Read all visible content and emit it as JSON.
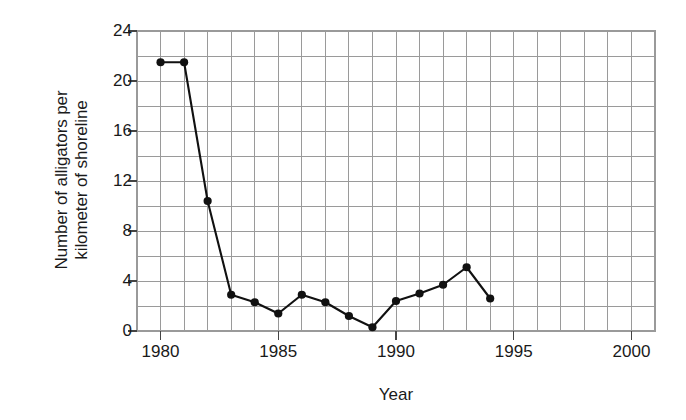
{
  "chart_data": {
    "type": "line",
    "title": "",
    "xlabel": "Year",
    "ylabel": "Number of alligators per kilometer of shoreline",
    "ylabel_lines": [
      "Number of alligators per",
      "kilometer of shoreline"
    ],
    "xlim": [
      1979,
      2001
    ],
    "ylim": [
      0,
      24
    ],
    "x_major_ticks": [
      1980,
      1985,
      1990,
      1995,
      2000
    ],
    "x_major_tick_labels": [
      "1980",
      "1985",
      "1990",
      "1995",
      "2000"
    ],
    "x_gridline_step": 1,
    "y_major_ticks": [
      0,
      4,
      8,
      12,
      16,
      20,
      24
    ],
    "y_major_tick_labels": [
      "0",
      "4",
      "8",
      "12",
      "16",
      "20",
      "24"
    ],
    "y_gridline_step": 2,
    "grid": true,
    "grid_color": "#9a9a9a",
    "legend": "none",
    "line_color": "#111111",
    "marker_color": "#111111",
    "marker_style": "filled-circle",
    "x": [
      1980,
      1981,
      1982,
      1983,
      1984,
      1985,
      1986,
      1987,
      1988,
      1989,
      1990,
      1991,
      1992,
      1993,
      1994
    ],
    "values": [
      21.5,
      21.5,
      10.4,
      2.9,
      2.3,
      1.4,
      2.9,
      2.3,
      1.2,
      0.3,
      2.4,
      3.0,
      3.7,
      5.1,
      2.6
    ],
    "series": [
      {
        "name": "Alligator density",
        "points": [
          {
            "year": 1980,
            "value": 21.5
          },
          {
            "year": 1981,
            "value": 21.5
          },
          {
            "year": 1982,
            "value": 10.4
          },
          {
            "year": 1983,
            "value": 2.9
          },
          {
            "year": 1984,
            "value": 2.3
          },
          {
            "year": 1985,
            "value": 1.4
          },
          {
            "year": 1986,
            "value": 2.9
          },
          {
            "year": 1987,
            "value": 2.3
          },
          {
            "year": 1988,
            "value": 1.2
          },
          {
            "year": 1989,
            "value": 0.3
          },
          {
            "year": 1990,
            "value": 2.4
          },
          {
            "year": 1991,
            "value": 3.0
          },
          {
            "year": 1992,
            "value": 3.7
          },
          {
            "year": 1993,
            "value": 5.1
          },
          {
            "year": 1994,
            "value": 2.6
          }
        ]
      }
    ]
  }
}
